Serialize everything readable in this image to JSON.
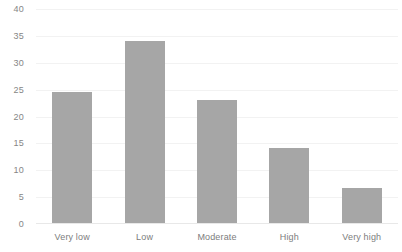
{
  "chart_data": {
    "type": "bar",
    "title": "",
    "subtitle": "",
    "xlabel": "",
    "ylabel": "",
    "categories": [
      "Very low",
      "Low",
      "Moderate",
      "High",
      "Very high"
    ],
    "values": [
      24.4,
      34,
      23,
      14,
      6.5
    ],
    "series": [
      {
        "name": "",
        "values": [
          24.4,
          34,
          23,
          14,
          6.5
        ]
      }
    ],
    "ylim": [
      0,
      40
    ],
    "ytick_labels": [
      "0",
      "5",
      "10",
      "15",
      "20",
      "25",
      "30",
      "35",
      "40"
    ],
    "ytick_values": [
      0,
      5,
      10,
      15,
      20,
      25,
      30,
      35,
      40
    ],
    "grid": "horizontal",
    "legend": "none",
    "bar_color": "#a6a6a6",
    "gridline_color": "#f2f2f2",
    "axis_text_color": "#868686",
    "background_color": "#ffffff"
  }
}
